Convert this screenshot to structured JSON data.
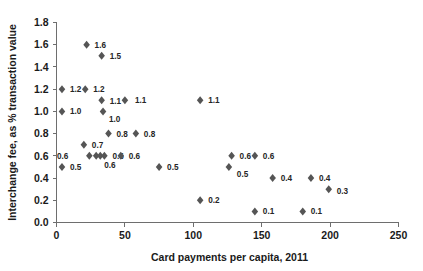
{
  "chart_data": {
    "type": "scatter",
    "title": "",
    "xlabel": "Card payments per capita, 2011",
    "ylabel": "Interchange fee, as % transaction value",
    "xlim": [
      0,
      250
    ],
    "ylim": [
      0.0,
      1.8
    ],
    "xticks": [
      "0",
      "50",
      "100",
      "150",
      "200",
      "250"
    ],
    "xtick_values": [
      0,
      50,
      100,
      150,
      200,
      250
    ],
    "yticks": [
      "0.0",
      "0.2",
      "0.4",
      "0.6",
      "0.8",
      "1.0",
      "1.2",
      "1.4",
      "1.6",
      "1.8"
    ],
    "ytick_values": [
      0.0,
      0.2,
      0.4,
      0.6,
      0.8,
      1.0,
      1.2,
      1.4,
      1.6,
      1.8
    ],
    "grid": false,
    "legend": false,
    "marker_color": "#555555",
    "axis_color": "#6e6e6e",
    "points": [
      {
        "x": 4,
        "y": 1.2,
        "label": "1.2",
        "lx": 8,
        "ly": 3
      },
      {
        "x": 4,
        "y": 1.0,
        "label": "1.0",
        "lx": 8,
        "ly": 3
      },
      {
        "x": 4,
        "y": 0.5,
        "label": "0.5",
        "lx": 8,
        "ly": 3
      },
      {
        "x": 21,
        "y": 1.2,
        "label": "1.2",
        "lx": 8,
        "ly": 3
      },
      {
        "x": 22,
        "y": 1.6,
        "label": "1.6",
        "lx": 8,
        "ly": 3
      },
      {
        "x": 20,
        "y": 0.7,
        "label": "0.7",
        "lx": 8,
        "ly": 3
      },
      {
        "x": 24,
        "y": 0.6,
        "label": "0.6",
        "lx": -21,
        "ly": 3
      },
      {
        "x": 29,
        "y": 0.6,
        "label": "0.6",
        "lx": 8,
        "ly": 12
      },
      {
        "x": 32,
        "y": 0.6,
        "label": "",
        "lx": 0,
        "ly": 0
      },
      {
        "x": 35,
        "y": 0.6,
        "label": "0.6",
        "lx": 8,
        "ly": 3
      },
      {
        "x": 33,
        "y": 1.1,
        "label": "1.1",
        "lx": 8,
        "ly": 4
      },
      {
        "x": 34,
        "y": 1.0,
        "label": "1.0",
        "lx": 6,
        "ly": 11
      },
      {
        "x": 33,
        "y": 1.5,
        "label": "1.5",
        "lx": 8,
        "ly": 3
      },
      {
        "x": 38,
        "y": 0.8,
        "label": "0.8",
        "lx": 8,
        "ly": 3
      },
      {
        "x": 47,
        "y": 0.6,
        "label": "0.6",
        "lx": 8,
        "ly": 3
      },
      {
        "x": 50,
        "y": 1.1,
        "label": "1.1",
        "lx": 10,
        "ly": 3
      },
      {
        "x": 58,
        "y": 0.8,
        "label": "0.8",
        "lx": 8,
        "ly": 3
      },
      {
        "x": 75,
        "y": 0.5,
        "label": "0.5",
        "lx": 8,
        "ly": 3
      },
      {
        "x": 105,
        "y": 1.1,
        "label": "1.1",
        "lx": 8,
        "ly": 3
      },
      {
        "x": 105,
        "y": 0.2,
        "label": "0.2",
        "lx": 8,
        "ly": 3
      },
      {
        "x": 128,
        "y": 0.6,
        "label": "0.6",
        "lx": 8,
        "ly": 3
      },
      {
        "x": 126,
        "y": 0.5,
        "label": "0.5",
        "lx": 8,
        "ly": 10
      },
      {
        "x": 145,
        "y": 0.6,
        "label": "0.6",
        "lx": 8,
        "ly": 3
      },
      {
        "x": 145,
        "y": 0.1,
        "label": "0.1",
        "lx": 8,
        "ly": 3
      },
      {
        "x": 158,
        "y": 0.4,
        "label": "0.4",
        "lx": 8,
        "ly": 3
      },
      {
        "x": 180,
        "y": 0.1,
        "label": "0.1",
        "lx": 8,
        "ly": 3
      },
      {
        "x": 186,
        "y": 0.4,
        "label": "0.4",
        "lx": 8,
        "ly": 3
      },
      {
        "x": 199,
        "y": 0.3,
        "label": "0.3",
        "lx": 8,
        "ly": 5
      }
    ]
  }
}
